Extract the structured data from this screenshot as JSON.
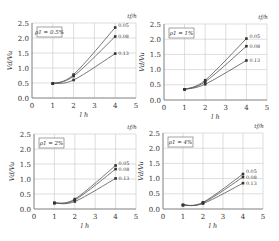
{
  "figure": {
    "panel_count": 4,
    "colors": {
      "curve": "#555555",
      "grid": "#c8c8c8",
      "axis": "#777777",
      "text": "#333333",
      "marker": "#333333"
    }
  },
  "chart_data": [
    {
      "type": "line",
      "title": "ρ1 = 0.5%",
      "annotation": "ρ1 = 0.5%",
      "xlabel": "l h",
      "ylabel": "Vd/Vu",
      "legend_title": "tf/h",
      "legend_position": "right end of curves",
      "xlim": [
        0,
        5
      ],
      "ylim": [
        0,
        2.5
      ],
      "xticks": [
        "0",
        "1",
        "2",
        "3",
        "4",
        "5"
      ],
      "yticks": [
        "0.0",
        "0.5",
        "1.0",
        "1.5",
        "2.0",
        "2.5"
      ],
      "grid": true,
      "x": [
        1,
        2,
        4
      ],
      "series": [
        {
          "name": "0.05",
          "values": [
            0.48,
            0.78,
            2.35
          ]
        },
        {
          "name": "0.08",
          "values": [
            0.48,
            0.73,
            2.05
          ]
        },
        {
          "name": "0.13",
          "values": [
            0.48,
            0.6,
            1.48
          ]
        }
      ]
    },
    {
      "type": "line",
      "title": "ρ1 = 1%",
      "annotation": "ρ1 = 1%",
      "xlabel": "l h",
      "ylabel": "Vd/Vu",
      "legend_title": "tf/h",
      "legend_position": "right end of curves",
      "xlim": [
        0,
        5
      ],
      "ylim": [
        0,
        2.5
      ],
      "xticks": [
        "0",
        "1",
        "2",
        "3",
        "4",
        "5"
      ],
      "yticks": [
        "0.0",
        "0.5",
        "1.0",
        "1.5",
        "2.0",
        "2.5"
      ],
      "grid": true,
      "x": [
        1,
        2,
        4
      ],
      "series": [
        {
          "name": "0.05",
          "values": [
            0.35,
            0.65,
            2.02
          ]
        },
        {
          "name": "0.08",
          "values": [
            0.35,
            0.6,
            1.77
          ]
        },
        {
          "name": "0.13",
          "values": [
            0.35,
            0.52,
            1.3
          ]
        }
      ]
    },
    {
      "type": "line",
      "title": "ρ1 = 2%",
      "annotation": "ρ1 = 2%",
      "xlabel": "l h",
      "ylabel": "Vd/Vu",
      "legend_title": "tf/h",
      "legend_position": "right end of curves",
      "xlim": [
        0,
        5
      ],
      "ylim": [
        0,
        2.5
      ],
      "xticks": [
        "0",
        "1",
        "2",
        "3",
        "4",
        "5"
      ],
      "yticks": [
        "0.0",
        "0.5",
        "1.0",
        "1.5",
        "2.0",
        "2.5"
      ],
      "grid": true,
      "x": [
        1,
        2,
        4
      ],
      "series": [
        {
          "name": "0.05",
          "values": [
            0.2,
            0.33,
            1.45
          ]
        },
        {
          "name": "0.08",
          "values": [
            0.2,
            0.3,
            1.33
          ]
        },
        {
          "name": "0.13",
          "values": [
            0.2,
            0.25,
            1.02
          ]
        }
      ]
    },
    {
      "type": "line",
      "title": "ρ1 = 4%",
      "annotation": "ρ1 = 4%",
      "xlabel": "l h",
      "ylabel": "Vd/Vu",
      "legend_title": "tf/h",
      "legend_position": "right end of curves",
      "xlim": [
        0,
        5
      ],
      "ylim": [
        0,
        2.5
      ],
      "xticks": [
        "0",
        "1",
        "2",
        "3",
        "4",
        "5"
      ],
      "yticks": [
        "0.0",
        "0.5",
        "1.0",
        "1.5",
        "2.0",
        "2.5"
      ],
      "grid": true,
      "x": [
        1,
        2,
        4
      ],
      "series": [
        {
          "name": "0.05",
          "values": [
            0.13,
            0.22,
            1.15
          ]
        },
        {
          "name": "0.08",
          "values": [
            0.13,
            0.2,
            1.05
          ]
        },
        {
          "name": "0.13",
          "values": [
            0.13,
            0.18,
            0.85
          ]
        }
      ]
    }
  ]
}
